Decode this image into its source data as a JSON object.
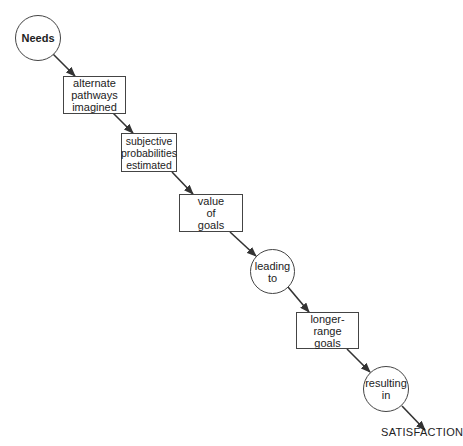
{
  "diagram": {
    "type": "flow",
    "colors": {
      "stroke": "#444444",
      "text": "#222222",
      "background": "#ffffff"
    },
    "nodes": [
      {
        "id": "needs",
        "shape": "circle",
        "label": "Needs"
      },
      {
        "id": "alternate-pathways",
        "shape": "rect",
        "label": "alternate\npathways\nimagined"
      },
      {
        "id": "subjective-probabilities",
        "shape": "rect",
        "label": "subjective\nprobabilities\nestimated"
      },
      {
        "id": "value-of-goals",
        "shape": "rect",
        "label": "value\nof\ngoals"
      },
      {
        "id": "leading-to",
        "shape": "circle",
        "label": "leading\nto"
      },
      {
        "id": "longer-range-goals",
        "shape": "rect",
        "label": "longer-range\ngoals"
      },
      {
        "id": "resulting-in",
        "shape": "circle",
        "label": "resulting\nin"
      }
    ],
    "terminal": {
      "id": "satisfaction",
      "label": "SATISFACTION"
    },
    "edges": [
      {
        "from": "needs",
        "to": "alternate-pathways"
      },
      {
        "from": "alternate-pathways",
        "to": "subjective-probabilities"
      },
      {
        "from": "subjective-probabilities",
        "to": "value-of-goals"
      },
      {
        "from": "value-of-goals",
        "to": "leading-to"
      },
      {
        "from": "leading-to",
        "to": "longer-range-goals"
      },
      {
        "from": "longer-range-goals",
        "to": "resulting-in"
      },
      {
        "from": "resulting-in",
        "to": "satisfaction"
      }
    ]
  }
}
